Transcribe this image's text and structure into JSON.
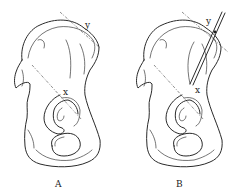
{
  "figure": {
    "panels": [
      {
        "id": "A",
        "caption": "A",
        "subject": "hip bone (os coxae), lateral view",
        "points": {
          "x": "x",
          "y": "y"
        },
        "annotations": [
          "dashed line through x",
          "dashed tangent line at y"
        ]
      },
      {
        "id": "B",
        "caption": "B",
        "subject": "hip bone (os coxae), lateral view with inserted pin",
        "points": {
          "x": "x",
          "y": "y"
        },
        "annotations": [
          "dashed line through x",
          "dashed tangent line at y",
          "pin from y toward x"
        ]
      }
    ],
    "colors": {
      "line": "#2a2a2a",
      "background": "#ffffff"
    }
  }
}
